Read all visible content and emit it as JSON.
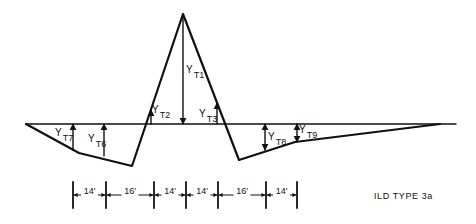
{
  "diagram": {
    "title": "ILD TYPE 3a",
    "baseline": {
      "x1": 26,
      "x2": 456,
      "y": 124
    },
    "outline": [
      [
        26,
        124
      ],
      [
        79,
        153
      ],
      [
        132,
        166
      ],
      [
        183,
        14
      ],
      [
        239,
        160
      ],
      [
        295,
        142
      ],
      [
        440,
        124
      ]
    ],
    "ordinates": [
      {
        "id": "YT1",
        "label": "Y",
        "sub": "T1",
        "x": 183,
        "y_from": 17,
        "y_to": 124,
        "arrow": "down",
        "lx": 186,
        "ly": 73
      },
      {
        "id": "YT2",
        "label": "Y",
        "sub": "T2",
        "x": 151,
        "y_from": 124,
        "y_to": 110,
        "arrow": "up",
        "lx": 152,
        "ly": 113
      },
      {
        "id": "YT3",
        "label": "Y",
        "sub": "T3",
        "x": 217,
        "y_from": 124,
        "y_to": 103,
        "arrow": "up",
        "lx": 199,
        "ly": 117
      },
      {
        "id": "YT7",
        "label": "Y",
        "sub": "T7",
        "x": 73,
        "y_from": 150,
        "y_to": 124,
        "arrow": "up",
        "lx": 55,
        "ly": 136
      },
      {
        "id": "YT6",
        "label": "Y",
        "sub": "T6",
        "x": 104,
        "y_from": 156,
        "y_to": 124,
        "arrow": "up",
        "lx": 88,
        "ly": 142
      },
      {
        "id": "YT8",
        "label": "Y",
        "sub": "T8",
        "x": 265,
        "y_from": 124,
        "y_to": 150,
        "arrow": "both",
        "lx": 268,
        "ly": 140
      },
      {
        "id": "YT9",
        "label": "Y",
        "sub": "T9",
        "x": 297,
        "y_from": 124,
        "y_to": 142,
        "arrow": "both",
        "lx": 299,
        "ly": 133
      }
    ],
    "dimension_line": {
      "y": 195,
      "tick_top": 182,
      "tick_bottom": 208,
      "ticks_x": [
        73,
        106,
        154,
        186,
        218,
        266,
        297
      ],
      "segments": [
        "14'",
        "16'",
        "14'",
        "14'",
        "16'",
        "14'"
      ]
    }
  }
}
